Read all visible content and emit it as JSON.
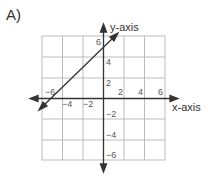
{
  "problem_label": "A)",
  "graph": {
    "x_axis_label": "x-axis",
    "y_axis_label": "y-axis",
    "x_ticks": [
      {
        "value": -6,
        "label": "−6"
      },
      {
        "value": -4,
        "label": "−4"
      },
      {
        "value": -2,
        "label": "−2"
      },
      {
        "value": 2,
        "label": "2"
      },
      {
        "value": 4,
        "label": "4"
      },
      {
        "value": 6,
        "label": "6"
      }
    ],
    "y_ticks": [
      {
        "value": 6,
        "label": "6"
      },
      {
        "value": 4,
        "label": "4"
      },
      {
        "value": 2,
        "label": "2"
      },
      {
        "value": -2,
        "label": "−2"
      },
      {
        "value": -4,
        "label": "−4"
      },
      {
        "value": -6,
        "label": "−6"
      }
    ],
    "line": {
      "slope": 1,
      "y_intercept": 5,
      "description": "y = x + 5"
    },
    "grid_range": [
      -6,
      6
    ],
    "grid_step": 2
  }
}
